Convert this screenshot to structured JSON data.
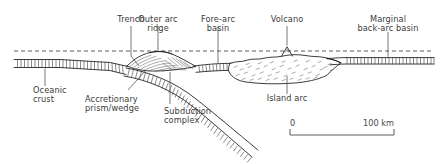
{
  "figure": {
    "type": "geological-cross-section",
    "background_color": "#ffffff",
    "ink_color": "#1a1a1a",
    "label_color": "#3b3b3b"
  },
  "labels": {
    "trench": "Trench",
    "outer_arc_ridge_line1": "Outer arc",
    "outer_arc_ridge_line2": "ridge",
    "fore_arc_basin_line1": "Fore-arc",
    "fore_arc_basin_line2": "basin",
    "volcano": "Volcano",
    "marginal_back_arc_line1": "Marginal",
    "marginal_back_arc_line2": "back-arc basin",
    "oceanic_crust_line1": "Oceanic",
    "oceanic_crust_line2": "crust",
    "accretionary_line1": "Accretionary",
    "accretionary_line2": "prism/wedge",
    "subduction_complex_line1": "Subduction",
    "subduction_complex_line2": "complex",
    "island_arc": "Island arc"
  },
  "scale": {
    "start_label": "0",
    "end_label": "100 km",
    "units": "km",
    "span_value": 100
  }
}
